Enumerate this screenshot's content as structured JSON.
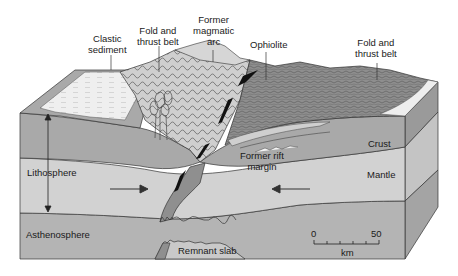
{
  "diagram": {
    "labels": {
      "clastic_sediment": [
        "Clastic",
        "sediment"
      ],
      "fold_thrust_left": [
        "Fold and",
        "thrust belt"
      ],
      "former_arc": [
        "Former",
        "magmatic",
        "arc"
      ],
      "ophiolite": "Ophiolite",
      "fold_thrust_right": [
        "Fold and",
        "thrust belt"
      ],
      "former_rift": [
        "Former rift",
        "margin"
      ],
      "crust": "Crust",
      "mantle": "Mantle",
      "lithosphere": "Lithosphere",
      "asthenosphere": "Asthenosphere",
      "remnant_slab": "Remnant slab"
    },
    "scale_bar": {
      "start": "0",
      "end": "50",
      "unit": "km",
      "ticks": 6
    },
    "arrows": {
      "left_plate": "right",
      "right_plate": "left"
    },
    "colors": {
      "crust": "#a9a9a9",
      "mantle": "#d2d2d2",
      "asthenosphere": "#b4b4b4",
      "side_crust": "#9a9a9a",
      "side_mantle": "#c4c4c4",
      "side_astheno": "#a4a4a4",
      "surface": "#c9c9c9",
      "surface_dark": "#8e8e8e",
      "sediment": "#eeeeee",
      "ophiolite": "#111111",
      "slab": "#8f8f8f",
      "line": "#333333"
    }
  }
}
